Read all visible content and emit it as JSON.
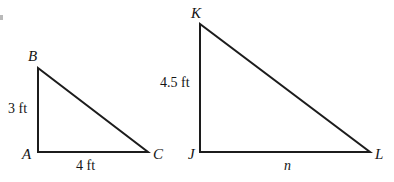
{
  "figure": {
    "background_color": "#ffffff",
    "stroke_color": "#1c1c1c",
    "stroke_width": 2,
    "width": 394,
    "height": 182
  },
  "triangles": [
    {
      "id": "triangle-abc",
      "name": "Triangle ABC",
      "vertices": [
        {
          "label": "A",
          "x": 38,
          "y": 152,
          "label_x": 22,
          "label_y": 147
        },
        {
          "label": "B",
          "x": 38,
          "y": 68,
          "label_x": 28,
          "label_y": 49
        },
        {
          "label": "C",
          "x": 148,
          "y": 152,
          "label_x": 153,
          "label_y": 147
        }
      ],
      "side_labels": [
        {
          "name": "leg-vertical",
          "text": "3 ft",
          "x": 8,
          "y": 102
        },
        {
          "name": "leg-horizontal",
          "text": "4 ft",
          "x": 76,
          "y": 159
        }
      ]
    },
    {
      "id": "triangle-jkl",
      "name": "Triangle JKL",
      "vertices": [
        {
          "label": "J",
          "x": 200,
          "y": 152,
          "label_x": 188,
          "label_y": 147
        },
        {
          "label": "K",
          "x": 200,
          "y": 24,
          "label_x": 191,
          "label_y": 6
        },
        {
          "label": "L",
          "x": 370,
          "y": 152,
          "label_x": 375,
          "label_y": 147
        }
      ],
      "side_labels": [
        {
          "name": "leg-vertical",
          "text": "4.5 ft",
          "x": 160,
          "y": 76
        },
        {
          "name": "leg-horizontal",
          "text": "n",
          "x": 284,
          "y": 159
        }
      ]
    }
  ]
}
